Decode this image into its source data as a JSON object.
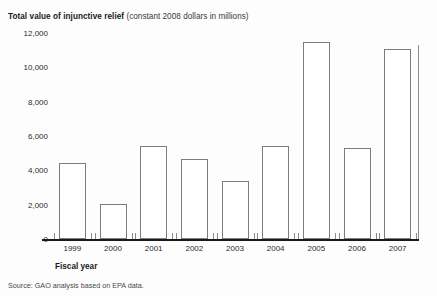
{
  "title": {
    "main": "Total value of injunctive relief",
    "sub": "(constant 2008 dollars in millions)"
  },
  "axis_title_x": "Fiscal year",
  "source_note": "Source: GAO analysis based on EPA data.",
  "chart_data": {
    "type": "bar",
    "title": "Total value of injunctive relief (constant 2008 dollars in millions)",
    "xlabel": "Fiscal year",
    "ylabel": "",
    "categories": [
      "1999",
      "2000",
      "2001",
      "2002",
      "2003",
      "2004",
      "2005",
      "2006",
      "2007"
    ],
    "values": [
      4450,
      2050,
      5400,
      4650,
      3400,
      5400,
      11450,
      5300,
      11050
    ],
    "ylim": [
      0,
      12000
    ],
    "ytick_labels": [
      "0",
      "2,000",
      "4,000",
      "6,000",
      "8,000",
      "10,000",
      "12,000"
    ],
    "ytick_values": [
      0,
      2000,
      4000,
      6000,
      8000,
      10000,
      12000
    ],
    "grid": false,
    "legend": null,
    "bar_fill": "#ffffff",
    "bar_edge": "#7d7d7d",
    "axis_color": "#1a1a1a",
    "background": "#fdfdfd"
  }
}
